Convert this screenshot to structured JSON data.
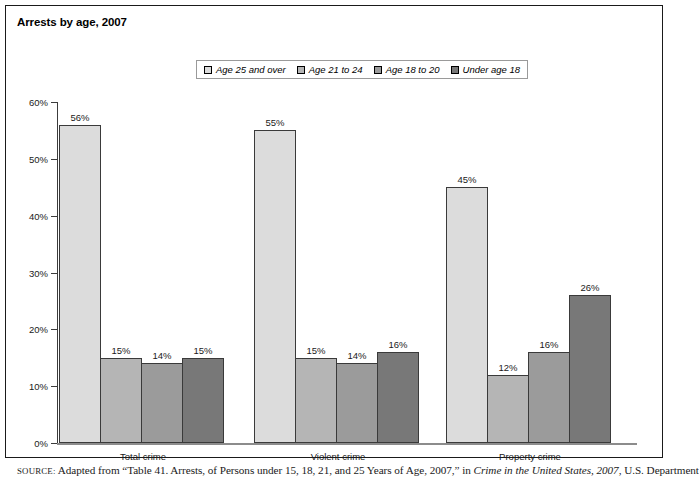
{
  "figure": {
    "title": "Arrests by age, 2007",
    "source_prefix": "SOURCE:",
    "source_part1": " Adapted from “Table 41. Arrests, of Persons under 15, 18, 21, and 25 Years of Age, 2007,” in ",
    "source_italic": "Crime in the United States, 2007",
    "source_part2": ", U.S. Department"
  },
  "chart_data": {
    "type": "bar",
    "title": "Arrests by age, 2007",
    "xlabel": "",
    "ylabel": "",
    "ylim": [
      0,
      60
    ],
    "ytick_labels": [
      "0%",
      "10%",
      "20%",
      "30%",
      "40%",
      "50%",
      "60%"
    ],
    "ytick_values": [
      0,
      10,
      20,
      30,
      40,
      50,
      60
    ],
    "grid": false,
    "legend_position": "top-center",
    "categories": [
      "Total crime",
      "Violent crime",
      "Property crime"
    ],
    "series": [
      {
        "name": "Age 25 and over",
        "color": "#dcdcdc",
        "values": [
          56,
          55,
          45
        ],
        "labels": [
          "56%",
          "55%",
          "45%"
        ]
      },
      {
        "name": "Age 21 to 24",
        "color": "#b5b5b5",
        "values": [
          15,
          15,
          12
        ],
        "labels": [
          "15%",
          "15%",
          "12%"
        ]
      },
      {
        "name": "Age 18 to 20",
        "color": "#9b9b9b",
        "values": [
          14,
          14,
          16
        ],
        "labels": [
          "14%",
          "14%",
          "16%"
        ]
      },
      {
        "name": "Under age 18",
        "color": "#787878",
        "values": [
          15,
          16,
          26
        ],
        "labels": [
          "15%",
          "16%",
          "26%"
        ]
      }
    ]
  }
}
